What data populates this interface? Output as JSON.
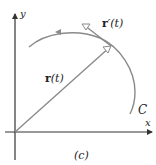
{
  "figure": {
    "caption": "(c)",
    "axes": {
      "x_label": "x",
      "y_label": "y"
    },
    "curve": {
      "label": "C",
      "color": "#8a8a8a"
    },
    "position_vector": {
      "bold_part": "r",
      "arg_part": "(t)",
      "label": "r(t)",
      "color": "#8a8a8a"
    },
    "tangent_vector": {
      "bold_part": "r",
      "prime_arg_part": "′(t)",
      "label": "r′(t)",
      "color": "#8a8a8a"
    },
    "axis_color": "#333333"
  }
}
